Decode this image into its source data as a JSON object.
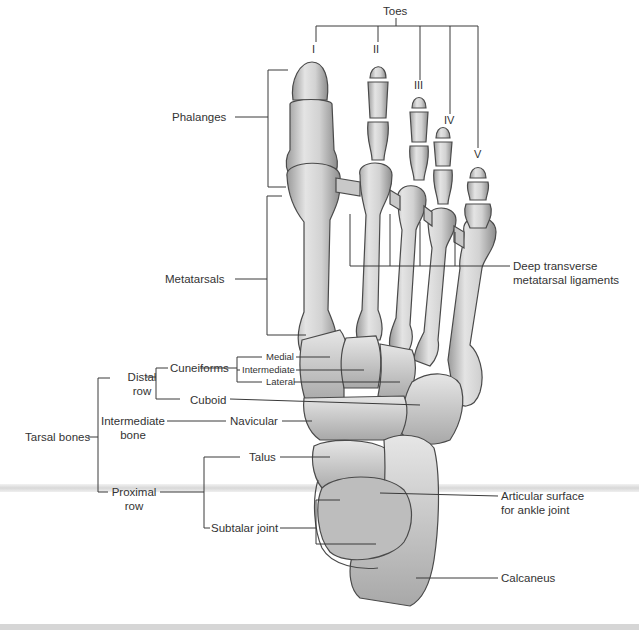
{
  "figure": {
    "background": "#ffffff",
    "bone_fill": "#d9d9d9",
    "line_color": "#333333"
  },
  "labels": {
    "toes": "Toes",
    "toe_numerals": [
      "I",
      "II",
      "III",
      "IV",
      "V"
    ],
    "phalanges": "Phalanges",
    "metatarsals": "Metatarsals",
    "deep_ligaments_1": "Deep transverse",
    "deep_ligaments_2": "metatarsal ligaments",
    "tarsal_bones": "Tarsal bones",
    "distal_row_1": "Distal",
    "distal_row_2": "row",
    "cuneiforms": "Cuneiforms",
    "cuneiform_medial": "Medial",
    "cuneiform_intermediate": "Intermediate",
    "cuneiform_lateral": "Lateral",
    "cuboid": "Cuboid",
    "intermediate_bone_1": "Intermediate",
    "intermediate_bone_2": "bone",
    "navicular": "Navicular",
    "talus": "Talus",
    "proximal_row_1": "Proximal",
    "proximal_row_2": "row",
    "subtalar_joint": "Subtalar joint",
    "articular_surface_1": "Articular surface",
    "articular_surface_2": "for ankle joint",
    "calcaneus": "Calcaneus"
  }
}
